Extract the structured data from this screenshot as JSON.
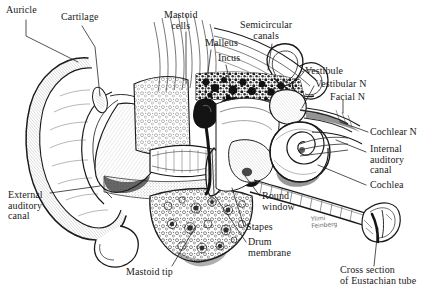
{
  "figure": {
    "background_color": "#ffffff",
    "ink_color": "#1a1a1a",
    "width": 425,
    "height": 293
  },
  "labels": [
    {
      "id": "auricle",
      "text": "Auricle",
      "x": 6,
      "y": 5,
      "align": "left"
    },
    {
      "id": "cartilage",
      "text": "Cartilage",
      "x": 61,
      "y": 12,
      "align": "left"
    },
    {
      "id": "mastoid-cells",
      "text": "Mastoid\ncells",
      "x": 164,
      "y": 10,
      "align": "center"
    },
    {
      "id": "malleus",
      "text": "Malleus",
      "x": 205,
      "y": 38,
      "align": "left"
    },
    {
      "id": "incus",
      "text": "Incus",
      "x": 218,
      "y": 53,
      "align": "left"
    },
    {
      "id": "semicircular-canals",
      "text": "Semicircular\ncanals",
      "x": 240,
      "y": 20,
      "align": "center"
    },
    {
      "id": "vestibule",
      "text": "Vestibule",
      "x": 305,
      "y": 66,
      "align": "left"
    },
    {
      "id": "vestibular-nerve",
      "text": "Vestibular N",
      "x": 315,
      "y": 79,
      "align": "left"
    },
    {
      "id": "facial-nerve",
      "text": "Facial N",
      "x": 330,
      "y": 92,
      "align": "left"
    },
    {
      "id": "cochlear-nerve",
      "text": "Cochlear N",
      "x": 370,
      "y": 127,
      "align": "left"
    },
    {
      "id": "internal-auditory-canal",
      "text": "Internal\nauditory\ncanal",
      "x": 370,
      "y": 144,
      "align": "left"
    },
    {
      "id": "cochlea",
      "text": "Cochlea",
      "x": 370,
      "y": 180,
      "align": "left"
    },
    {
      "id": "external-auditory-canal",
      "text": "External\nauditory\ncanal",
      "x": 8,
      "y": 190,
      "align": "left"
    },
    {
      "id": "round-window",
      "text": "Round\nwindow",
      "x": 262,
      "y": 191,
      "align": "left"
    },
    {
      "id": "stapes",
      "text": "Stapes",
      "x": 246,
      "y": 222,
      "align": "left"
    },
    {
      "id": "drum-membrane",
      "text": "Drum\nmembrane",
      "x": 248,
      "y": 237,
      "align": "left"
    },
    {
      "id": "mastoid-tip",
      "text": "Mastoid tip",
      "x": 126,
      "y": 267,
      "align": "left"
    },
    {
      "id": "cross-section-eustachian-tube",
      "text": "Cross section\nof Eustachian tube",
      "x": 340,
      "y": 265,
      "align": "left"
    }
  ],
  "signature": {
    "text": "Ylimi\nFeinberg",
    "x": 311,
    "y": 215
  },
  "leader_lines": [
    {
      "id": "leader-auricle",
      "points": "26,20 26,36 78,62"
    },
    {
      "id": "leader-cartilage",
      "points": "82,26 95,47 100,96"
    },
    {
      "id": "leader-mastoid-cells",
      "points": "186,32 186,84"
    },
    {
      "id": "leader-malleus",
      "points": "211,50 205,95"
    },
    {
      "id": "leader-incus",
      "points": "226,65 233,97"
    },
    {
      "id": "leader-semicircular",
      "points": "272,44 268,70"
    },
    {
      "id": "leader-vestibule",
      "points": "304,72 293,84"
    },
    {
      "id": "leader-vestibular-nerve",
      "points": "314,86 302,108"
    },
    {
      "id": "leader-facial-nerve",
      "points": "343,100 343,113"
    },
    {
      "id": "leader-cochlear-nerve",
      "points": "368,132 340,122"
    },
    {
      "id": "leader-internal-canal",
      "points": "366,152 336,140"
    },
    {
      "id": "leader-cochlea",
      "points": "366,185 318,165"
    },
    {
      "id": "leader-external-canal",
      "points": "50,193 100,186"
    },
    {
      "id": "leader-round-window",
      "points": "260,196 245,176"
    },
    {
      "id": "leader-stapes",
      "points": "244,226 232,188"
    },
    {
      "id": "leader-drum-membrane",
      "points": "246,242 215,196"
    },
    {
      "id": "leader-mastoid-tip",
      "points": "172,266 196,226"
    },
    {
      "id": "leader-eustachian",
      "points": "374,266 378,228"
    }
  ]
}
